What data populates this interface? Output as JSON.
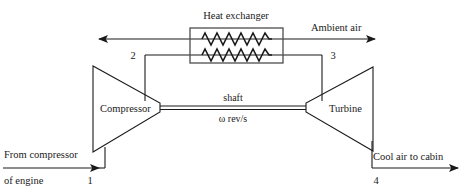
{
  "diagram": {
    "components": {
      "compressor": {
        "label": "Compressor",
        "name": "compressor"
      },
      "turbine": {
        "label": "Turbine",
        "name": "turbine"
      },
      "heat_exchanger": {
        "label": "Heat exchanger",
        "name": "heat-exchanger"
      },
      "shaft": {
        "label": "shaft",
        "speed_label": "ω rev/s"
      }
    },
    "flow_labels": {
      "ambient_air": "Ambient air",
      "inlet_line1": "From compressor",
      "inlet_line2": "of engine",
      "outlet": "Cool air to cabin"
    },
    "state_points": [
      {
        "id": "1",
        "label": "1"
      },
      {
        "id": "2",
        "label": "2"
      },
      {
        "id": "3",
        "label": "3"
      },
      {
        "id": "4",
        "label": "4"
      }
    ],
    "colors": {
      "line": "#1a1a1a",
      "text": "#1a1a1a",
      "background": "#ffffff",
      "box_stroke": "#555555"
    }
  }
}
